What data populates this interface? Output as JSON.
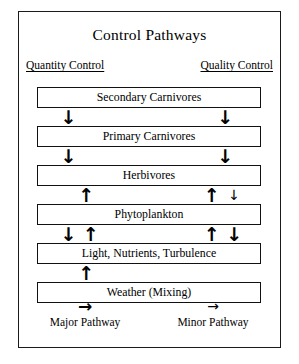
{
  "figure": {
    "title": "Control Pathways",
    "columns": [
      {
        "label": "Quantity Control",
        "side": "left"
      },
      {
        "label": "Quality Control",
        "side": "right"
      }
    ],
    "boxes": [
      {
        "label": "Secondary Carnivores"
      },
      {
        "label": "Primary Carnivores"
      },
      {
        "label": "Herbivores"
      },
      {
        "label": "Phytoplankton"
      },
      {
        "label": "Light, Nutrients, Turbulence"
      },
      {
        "label": "Weather (Mixing)"
      }
    ],
    "gaps": [
      {
        "between": "Secondary Carnivores-Primary Carnivores",
        "arrows": [
          {
            "glyph": "↓",
            "weight": "major",
            "direction": "down",
            "x_pct": 14
          },
          {
            "glyph": "↓",
            "weight": "major",
            "direction": "down",
            "x_pct": 84
          }
        ]
      },
      {
        "between": "Primary Carnivores-Herbivores",
        "arrows": [
          {
            "glyph": "↓",
            "weight": "major",
            "direction": "down",
            "x_pct": 14
          },
          {
            "glyph": "↓",
            "weight": "major",
            "direction": "down",
            "x_pct": 84
          }
        ]
      },
      {
        "between": "Herbivores-Phytoplankton",
        "arrows": [
          {
            "glyph": "↑",
            "weight": "major",
            "direction": "up",
            "x_pct": 22
          },
          {
            "glyph": "↑",
            "weight": "major",
            "direction": "up",
            "x_pct": 78
          },
          {
            "glyph": "↓",
            "weight": "minor",
            "direction": "down",
            "x_pct": 88
          }
        ]
      },
      {
        "between": "Phytoplankton-Light, Nutrients, Turbulence",
        "arrows": [
          {
            "glyph": "↓",
            "weight": "major",
            "direction": "down",
            "x_pct": 14
          },
          {
            "glyph": "↑",
            "weight": "major",
            "direction": "up",
            "x_pct": 24
          },
          {
            "glyph": "↑",
            "weight": "major",
            "direction": "up",
            "x_pct": 78
          },
          {
            "glyph": "↓",
            "weight": "major",
            "direction": "down",
            "x_pct": 88
          }
        ]
      },
      {
        "between": "Light, Nutrients, Turbulence-Weather (Mixing)",
        "arrows": [
          {
            "glyph": "↑",
            "weight": "major",
            "direction": "up",
            "x_pct": 22
          }
        ]
      }
    ],
    "legend": [
      {
        "glyph": "→",
        "weight": "major",
        "label": "Major Pathway"
      },
      {
        "glyph": "→",
        "weight": "minor",
        "label": "Minor Pathway"
      }
    ]
  }
}
